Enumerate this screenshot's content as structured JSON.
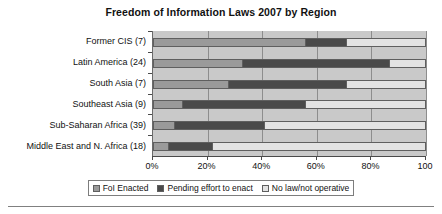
{
  "chart_data": {
    "type": "bar",
    "orientation": "horizontal",
    "stacked": true,
    "stack_mode": "percent",
    "title": "Freedom of Information Laws 2007 by Region",
    "xlabel": "",
    "ylabel": "",
    "xlim": [
      0,
      100
    ],
    "grid": true,
    "legend_position": "bottom",
    "xticks": [
      0,
      20,
      40,
      60,
      80,
      100
    ],
    "xtick_labels": [
      "0%",
      "20%",
      "40%",
      "60%",
      "80%",
      "100"
    ],
    "categories": [
      "Former CIS (7)",
      "Latin America (24)",
      "South Asia (7)",
      "Southeast Asia (9)",
      "Sub-Saharan Africa (39)",
      "Middle East and N. Africa (18)"
    ],
    "series": [
      {
        "name": "FoI Enacted",
        "color": "#9a9a9a",
        "values": [
          56,
          33,
          28,
          11,
          8,
          6
        ]
      },
      {
        "name": "Pending effort to enact",
        "color": "#4a4a4a",
        "values": [
          15,
          54,
          43,
          45,
          33,
          16
        ]
      },
      {
        "name": "No law/not operative",
        "color": "#e3e3e3",
        "values": [
          29,
          13,
          29,
          44,
          59,
          78
        ]
      }
    ],
    "cumulative_boundaries": [
      [
        56,
        71
      ],
      [
        33,
        87
      ],
      [
        28,
        71
      ],
      [
        11,
        56
      ],
      [
        8,
        41
      ],
      [
        6,
        22
      ]
    ]
  },
  "legend": {
    "items": [
      {
        "label": "FoI Enacted",
        "color": "#9a9a9a"
      },
      {
        "label": "Pending effort to enact",
        "color": "#4a4a4a"
      },
      {
        "label": "No law/not operative",
        "color": "#e3e3e3"
      }
    ]
  },
  "colors": {
    "plot_background": "#c9c9c9",
    "gridline": "#8d8d8d",
    "axis": "#4a4a4a",
    "page_background": "#ffffff",
    "text": "#111111"
  }
}
